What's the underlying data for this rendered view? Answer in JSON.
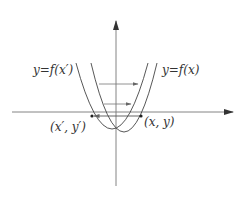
{
  "diagram": {
    "type": "function-translation-graph",
    "colors": {
      "axis": "#555555",
      "curve": "#444444",
      "arrow": "#666666",
      "point": "#222222",
      "text": "#333333",
      "background": "#ffffff"
    },
    "labels": {
      "curve_left": "y=f(x′)",
      "curve_right": "y=f(x)",
      "point_left": "(x′, y′)",
      "point_right": "(x, y)"
    },
    "curves": [
      {
        "name": "y=f(x′)",
        "shape": "upward parabola",
        "position": "left"
      },
      {
        "name": "y=f(x)",
        "shape": "upward parabola",
        "position": "right"
      }
    ],
    "arrows": [
      {
        "direction": "right",
        "level": "upper"
      },
      {
        "direction": "right",
        "level": "middle"
      },
      {
        "direction": "left",
        "level": "x-axis",
        "from": "(x, y)",
        "to": "(x′, y′)"
      }
    ],
    "points": [
      "(x′, y′)",
      "(x, y)"
    ]
  }
}
